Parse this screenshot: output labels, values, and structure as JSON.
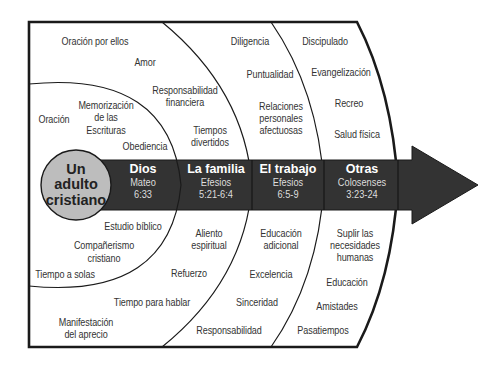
{
  "colors": {
    "arrow": "#333333",
    "hub_fill": "#bdbdbd",
    "line": "#1a1a1a",
    "text": "#333333"
  },
  "hub": {
    "line1": "Un",
    "line2": "adulto",
    "line3": "cristiano"
  },
  "bands": [
    {
      "title": "Dios",
      "ref1": "Mateo",
      "ref2": "6:33"
    },
    {
      "title": "La familia",
      "ref1": "Efesios",
      "ref2": "5:21-6:4"
    },
    {
      "title": "El trabajo",
      "ref1": "Efesios",
      "ref2": "6:5-9"
    },
    {
      "title": "Otras",
      "ref1": "Colosenses",
      "ref2": "3:23-24"
    }
  ],
  "zones": {
    "dios": {
      "top": [
        "Oración",
        "Memorización",
        "de las",
        "Escrituras",
        "Obediencia"
      ],
      "bottom": [
        "Estudio bíblico",
        "Compañerismo",
        "cristiano",
        "Tiempo a solas"
      ]
    },
    "familia": {
      "top": [
        "Oración por ellos",
        "Amor",
        "Responsabilidad",
        "financiera",
        "Tiempos",
        "divertidos"
      ],
      "bottom": [
        "Aliento",
        "espiritual",
        "Refuerzo",
        "Tiempo para hablar",
        "Manifestación",
        "del aprecio"
      ]
    },
    "trabajo": {
      "top": [
        "Diligencia",
        "Puntualidad",
        "Relaciones",
        "personales",
        "afectuosas"
      ],
      "bottom": [
        "Educación",
        "adicional",
        "Excelencia",
        "Sinceridad",
        "Responsabilidad"
      ]
    },
    "otras": {
      "top": [
        "Discipulado",
        "Evangelización",
        "Recreo",
        "Salud física"
      ],
      "bottom": [
        "Suplir las",
        "necesidades",
        "humanas",
        "Educación",
        "Amistades",
        "Pasatiempos"
      ]
    }
  }
}
